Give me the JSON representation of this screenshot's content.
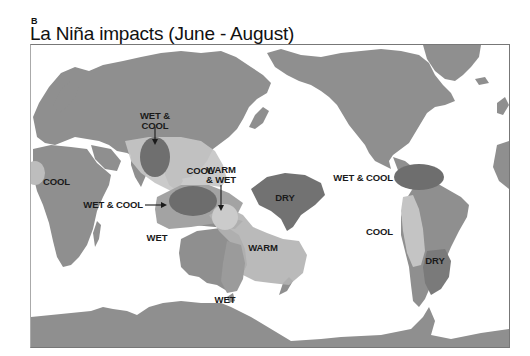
{
  "figure": {
    "panel_letter": "B",
    "title": "La Niña impacts (June - August)"
  },
  "colors": {
    "land": "#8f8f8f",
    "cool_region": "#c4c4c4",
    "wet_region": "#9e9e9e",
    "warm_region": "#b0b0b0",
    "dry_region": "#707070",
    "wet_cool_region": "#6e6e6e",
    "text": "#1a1a1a"
  },
  "regions": [
    {
      "id": "wet-cool-india",
      "label_line1": "WET &",
      "label_line2": "COOL"
    },
    {
      "id": "cool-southeast-asia",
      "label": "COOL"
    },
    {
      "id": "cool-west-africa",
      "label": "COOL"
    },
    {
      "id": "warm-wet-pacific",
      "label_line1": "WARM",
      "label_line2": "& WET"
    },
    {
      "id": "wet-cool-maritime",
      "label": "WET & COOL"
    },
    {
      "id": "wet-indonesia",
      "label": "WET"
    },
    {
      "id": "dry-central-pacific",
      "label": "DRY"
    },
    {
      "id": "warm-australia-east",
      "label": "WARM"
    },
    {
      "id": "wet-southeast-australia",
      "label": "WET"
    },
    {
      "id": "wet-cool-central-america",
      "label": "WET & COOL"
    },
    {
      "id": "cool-south-america-west",
      "label": "COOL"
    },
    {
      "id": "dry-south-america",
      "label": "DRY"
    }
  ]
}
